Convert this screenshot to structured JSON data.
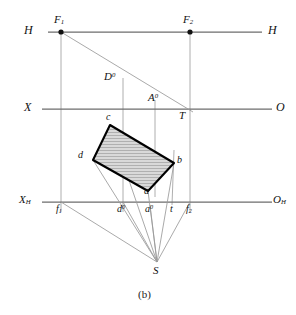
{
  "figure": {
    "caption": "(b)",
    "colors": {
      "axis": "#6d6d6d",
      "thin": "#9a9a9a",
      "outline": "#000000",
      "fill": "#d6d6d6",
      "hatch": "#9f9f9f",
      "text": "#111111"
    },
    "axes": [
      {
        "name": "h-line",
        "label_left": "H",
        "label_right": "H",
        "y": 32,
        "x1": 48,
        "x2": 262
      },
      {
        "name": "x-o-line",
        "label_left": "X",
        "label_right": "O",
        "y": 109,
        "x1": 42,
        "x2": 272
      },
      {
        "name": "xh-oh-line",
        "label_left": "X",
        "label_left_sub": "H",
        "label_right": "O",
        "label_right_sub": "H",
        "y": 202,
        "x1": 42,
        "x2": 272
      }
    ],
    "points": [
      {
        "name": "F1",
        "label": "F",
        "sub": "1",
        "x": 61,
        "y": 32,
        "dot": true
      },
      {
        "name": "F2",
        "label": "F",
        "sub": "2",
        "x": 190,
        "y": 32,
        "dot": true
      },
      {
        "name": "D0",
        "label": "D",
        "sup": "0",
        "x": 123,
        "y": 84,
        "dot": false
      },
      {
        "name": "A0",
        "label": "A",
        "sup": "0",
        "x": 155,
        "y": 104,
        "dot": false
      },
      {
        "name": "T",
        "label": "T",
        "x": 190,
        "y": 109,
        "dot": false
      },
      {
        "name": "c",
        "label": "c",
        "x": 110,
        "y": 125,
        "dot": false
      },
      {
        "name": "d",
        "label": "d",
        "x": 93,
        "y": 160,
        "dot": false
      },
      {
        "name": "b",
        "label": "b",
        "x": 174,
        "y": 163,
        "dot": false
      },
      {
        "name": "a",
        "label": "a",
        "x": 148,
        "y": 191,
        "dot": false
      },
      {
        "name": "f1",
        "label": "f",
        "sub": "1",
        "x": 61,
        "y": 202,
        "dot": false
      },
      {
        "name": "d0",
        "label": "d",
        "sup": "0",
        "x": 123,
        "y": 202,
        "dot": false
      },
      {
        "name": "a0",
        "label": "a",
        "sup": "0",
        "x": 150,
        "y": 202,
        "dot": false
      },
      {
        "name": "t",
        "label": "t",
        "x": 172,
        "y": 202,
        "dot": false
      },
      {
        "name": "f2",
        "label": "f",
        "sub": "2",
        "x": 190,
        "y": 202,
        "dot": false
      },
      {
        "name": "S",
        "label": "S",
        "x": 157,
        "y": 262,
        "dot": false
      }
    ],
    "quad": {
      "name": "shaded-parallelogram",
      "vertices": [
        {
          "id": "c",
          "x": 110,
          "y": 125
        },
        {
          "id": "b",
          "x": 174,
          "y": 163
        },
        {
          "id": "a",
          "x": 148,
          "y": 191
        },
        {
          "id": "d",
          "x": 93,
          "y": 160
        }
      ]
    },
    "labels": {
      "H_left": "H",
      "H_right": "H",
      "X_left": "X",
      "O_right": "O",
      "XH_left": "X",
      "XH_sub": "H",
      "OH_right": "O",
      "OH_sub": "H",
      "F1": "F",
      "F1_sub": "1",
      "F2": "F",
      "F2_sub": "2",
      "D0": "D",
      "D0_sup": "0",
      "A0": "A",
      "A0_sup": "0",
      "T": "T",
      "c": "c",
      "d": "d",
      "b": "b",
      "a": "a",
      "f1": "f",
      "f1_sub": "1",
      "d0": "d",
      "d0_sup": "0",
      "a0": "a",
      "a0_sup": "0",
      "t": "t",
      "f2": "f",
      "f2_sub": "2",
      "S": "S"
    }
  }
}
